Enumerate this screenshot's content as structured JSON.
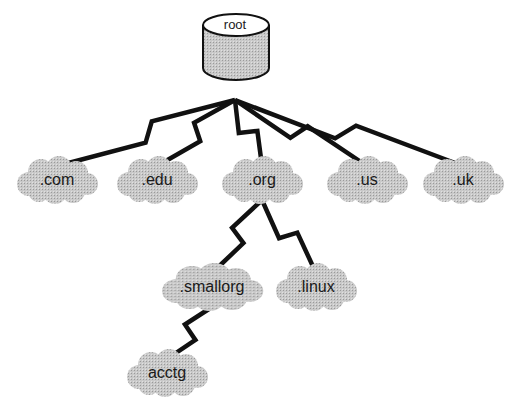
{
  "diagram": {
    "root": {
      "label": "root",
      "x": 235,
      "y": 24
    },
    "nodes": [
      {
        "id": "com",
        "label": ".com",
        "x": 57,
        "y": 180
      },
      {
        "id": "edu",
        "label": ".edu",
        "x": 157,
        "y": 180
      },
      {
        "id": "org",
        "label": ".org",
        "x": 262,
        "y": 180
      },
      {
        "id": "us",
        "label": ".us",
        "x": 367,
        "y": 180
      },
      {
        "id": "uk",
        "label": ".uk",
        "x": 463,
        "y": 180
      },
      {
        "id": "smallorg",
        "label": ".smallorg",
        "x": 212,
        "y": 287
      },
      {
        "id": "linux",
        "label": ".linux",
        "x": 316,
        "y": 287
      },
      {
        "id": "acctg",
        "label": "acctg",
        "x": 167,
        "y": 373
      }
    ],
    "edges": [
      {
        "from": "root",
        "to": "com"
      },
      {
        "from": "root",
        "to": "edu"
      },
      {
        "from": "root",
        "to": "org"
      },
      {
        "from": "root",
        "to": "us"
      },
      {
        "from": "root",
        "to": "uk"
      },
      {
        "from": "org",
        "to": "smallorg"
      },
      {
        "from": "org",
        "to": "linux"
      },
      {
        "from": "smallorg",
        "to": "acctg"
      }
    ],
    "colors": {
      "line": "#111111",
      "cloud": "#b8b8b8",
      "cylinder": "#c8c8c8",
      "text": "#1a1a1a"
    }
  }
}
